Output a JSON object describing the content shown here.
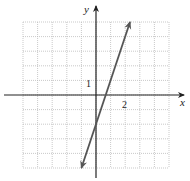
{
  "chart_data": {
    "type": "line",
    "title": "",
    "xlabel": "x",
    "ylabel": "y",
    "xlim": [
      -5,
      5
    ],
    "ylim": [
      -5,
      5
    ],
    "grid": true,
    "grid_spacing": 1,
    "tick_labels": {
      "x": [
        "2"
      ],
      "y": [
        "1"
      ]
    },
    "series": [
      {
        "name": "y = 3x - 2",
        "equation": "y = 3x - 2",
        "slope": 3,
        "intercept": -2,
        "x": [
          -1,
          2.33
        ],
        "y": [
          -5,
          5
        ],
        "arrows": "both"
      }
    ],
    "colors": {
      "line": "#555555",
      "axes": "#222222",
      "grid": "#bbbbbb"
    }
  },
  "labels": {
    "x_axis": "x",
    "y_axis": "y",
    "x_tick": "2",
    "y_tick": "1"
  }
}
